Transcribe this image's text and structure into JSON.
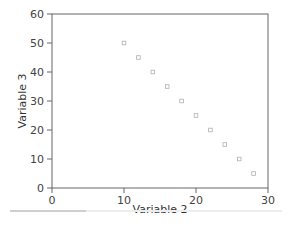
{
  "chart_data": {
    "type": "scatter",
    "title": "",
    "xlabel": "Variable 2",
    "ylabel": "Variable 3",
    "xlim": [
      0,
      30
    ],
    "ylim": [
      0,
      60
    ],
    "xticks": [
      0,
      10,
      20,
      30
    ],
    "yticks": [
      0,
      10,
      20,
      30,
      40,
      50,
      60
    ],
    "grid": false,
    "legend": null,
    "series": [
      {
        "name": "points",
        "marker": "open-square",
        "color": "#b0b0b0",
        "x": [
          10,
          12,
          14,
          16,
          18,
          20,
          22,
          24,
          26,
          28
        ],
        "y": [
          50,
          45,
          40,
          35,
          30,
          25,
          20,
          15,
          10,
          5
        ]
      }
    ]
  },
  "colors": {
    "axis": "#666666",
    "marker": "#b0b0b0"
  }
}
